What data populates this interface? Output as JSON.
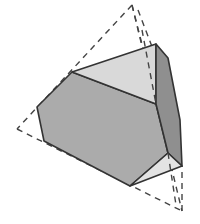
{
  "diagram": {
    "type": "geometric-solid",
    "faces": [
      {
        "name": "hexagon-face-front",
        "points": "72,72 156,104 168,153 130,186 44,141 37,107",
        "fill": "#ababab"
      },
      {
        "name": "triangle-face-top",
        "points": "72,72 156,44 156,104",
        "fill": "#d9d9d9"
      },
      {
        "name": "hexagon-face-right",
        "points": "156,44 168,58 180,120 182,166 168,153 156,104",
        "fill": "#8f8f8f"
      },
      {
        "name": "triangle-face-bottom",
        "points": "130,186 168,153 182,166",
        "fill": "#e3e3e3"
      }
    ],
    "tetrahedron_dashed_edges": [
      {
        "name": "edge-top-left",
        "x1": 132,
        "y1": 5,
        "x2": 17,
        "y2": 129
      },
      {
        "name": "edge-top-right",
        "x1": 132,
        "y1": 5,
        "x2": 182,
        "y2": 211
      },
      {
        "name": "edge-top-back",
        "x1": 132,
        "y1": 5,
        "x2": 146,
        "y2": 60
      },
      {
        "name": "edge-left-bottom",
        "x1": 17,
        "y1": 129,
        "x2": 182,
        "y2": 211
      },
      {
        "name": "edge-inner-right",
        "x1": 138,
        "y1": 10,
        "x2": 180,
        "y2": 120
      },
      {
        "name": "edge-bottom-up",
        "x1": 182,
        "y1": 211,
        "x2": 182,
        "y2": 166
      },
      {
        "name": "edge-top-hidden",
        "x1": 142,
        "y1": 30,
        "x2": 156,
        "y2": 104
      },
      {
        "name": "edge-bottom-hidden",
        "x1": 168,
        "y1": 153,
        "x2": 176,
        "y2": 205
      }
    ],
    "colors": {
      "stroke": "#333333",
      "dash": "#444444",
      "background": "#ffffff"
    }
  }
}
